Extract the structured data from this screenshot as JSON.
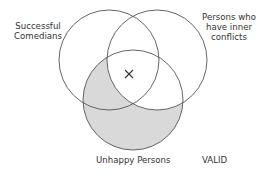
{
  "diagram": {
    "type": "venn",
    "sets": [
      {
        "id": "left",
        "label_lines": [
          "Successful",
          "Comedians"
        ],
        "cx": 109,
        "cy": 60,
        "r": 50
      },
      {
        "id": "right",
        "label_lines": [
          "Persons who",
          "have inner",
          "conflicts"
        ],
        "cx": 157,
        "cy": 60,
        "r": 50
      },
      {
        "id": "bottom",
        "label_lines": [
          "Unhappy Persons"
        ],
        "cx": 133,
        "cy": 100,
        "r": 50
      }
    ],
    "shaded_region": "bottom minus right",
    "marker": {
      "symbol": "X",
      "region": "left ∩ right ∩ bottom",
      "x": 129,
      "y": 74
    },
    "verdict": "VALID",
    "colors": {
      "stroke": "#555555",
      "shade": "#d9d9d9",
      "text": "#333333",
      "background": "#ffffff"
    }
  }
}
